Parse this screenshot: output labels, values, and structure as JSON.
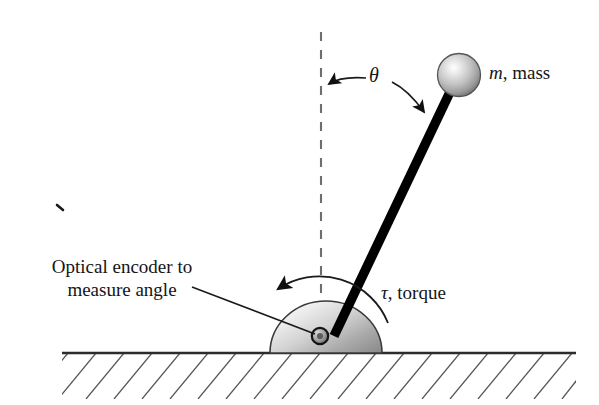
{
  "figure": {
    "background_color": "#ffffff",
    "width": 599,
    "height": 405
  },
  "labels": {
    "encoder": "Optical encoder to measure angle",
    "encoder_line_1": "Optical encoder to",
    "encoder_line_2": "measure angle",
    "mass_symbol": "m",
    "mass_text": ", mass",
    "mass_full": "m, mass",
    "torque_symbol": "τ",
    "torque_text": ", torque",
    "torque_full": "τ, torque",
    "theta_symbol": "θ"
  },
  "colors": {
    "ink": "#151515",
    "rod": "#000000",
    "ground_line": "#2b2b2b",
    "hatch": "#4a4a4a",
    "dashed_line": "#6e6e6e",
    "hemisphere_light": "#f2f2f2",
    "hemisphere_mid": "#c8c8c8",
    "hemisphere_dark": "#8d8d8d",
    "hemisphere_edge": "#3a3a3a",
    "sphere_highlight": "#ffffff",
    "sphere_mid": "#cfcfcf",
    "sphere_dark": "#7d7d7d",
    "pivot_fill": "#9a9a9a",
    "pivot_edge": "#1a1a1a"
  },
  "geometry": {
    "ground": {
      "x1": 62,
      "x2": 576,
      "y": 353
    },
    "pivot": {
      "cx": 320,
      "cy": 336,
      "r": 8
    },
    "hemisphere": {
      "cx": 326,
      "cy": 353,
      "rx": 56,
      "ry": 52
    },
    "dashed_vertical": {
      "x": 321,
      "y_top": 32,
      "y_bottom": 348
    },
    "rod": {
      "x1": 334,
      "y1": 334,
      "x2": 450,
      "y2": 92,
      "width": 9
    },
    "mass_sphere": {
      "cx": 459,
      "cy": 75,
      "r": 21
    },
    "theta_arrow_to_dash": {
      "tip_x": 325,
      "tip_y": 85
    },
    "theta_arrow_to_rod": {
      "tip_x": 427,
      "tip_y": 116
    },
    "torque_arc_arrow_tip": {
      "x": 271,
      "y": 288
    },
    "encoder_pointer": {
      "x1": 192,
      "y1": 287,
      "x2": 316,
      "y2": 334
    },
    "stray_mark": {
      "x": 60,
      "y": 207
    }
  },
  "elements": {
    "ground_name": "ground-hatched-surface",
    "hemisphere_name": "encoder-hemisphere",
    "rod_name": "pendulum-rod",
    "sphere_name": "pendulum-mass-sphere",
    "dashed_name": "vertical-reference-dashed-line",
    "theta_arc_name": "theta-angle-annotation",
    "torque_arc_name": "torque-arc-arrow",
    "pointer_name": "encoder-leader-line"
  }
}
